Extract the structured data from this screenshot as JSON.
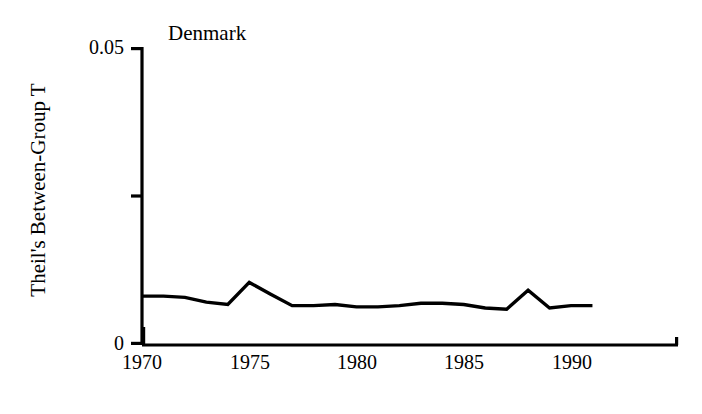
{
  "chart_data": {
    "type": "line",
    "title": "Denmark",
    "xlabel": "",
    "ylabel": "Theil's Between-Group T",
    "xlim": [
      1970,
      1991
    ],
    "ylim": [
      0,
      0.05
    ],
    "xticks": [
      1970,
      1975,
      1980,
      1985,
      1990
    ],
    "xtick_labels": [
      "1970",
      "1975",
      "1980",
      "1985",
      "1990"
    ],
    "yticks": [
      0,
      0.025,
      0.05
    ],
    "ytick_labels": [
      "0",
      "",
      "0.05"
    ],
    "grid": false,
    "legend": "none",
    "series": [
      {
        "name": "Theil's Between-Group T",
        "color": "#000000",
        "x": [
          1970,
          1971,
          1972,
          1973,
          1974,
          1975,
          1976,
          1977,
          1978,
          1979,
          1980,
          1981,
          1982,
          1983,
          1984,
          1985,
          1986,
          1987,
          1988,
          1989,
          1990,
          1991
        ],
        "values": [
          0.0082,
          0.0082,
          0.008,
          0.0072,
          0.0068,
          0.0105,
          0.0085,
          0.0066,
          0.0066,
          0.0068,
          0.0064,
          0.0064,
          0.0066,
          0.007,
          0.007,
          0.0068,
          0.0062,
          0.006,
          0.0092,
          0.0062,
          0.0066,
          0.0066
        ]
      }
    ]
  },
  "axis": {
    "y_top_label": "0.05",
    "y_bottom_label": "0",
    "x_labels": [
      "1970",
      "1975",
      "1980",
      "1985",
      "1990"
    ]
  },
  "colors": {
    "line": "#000000",
    "axis": "#000000",
    "background": "#ffffff"
  }
}
